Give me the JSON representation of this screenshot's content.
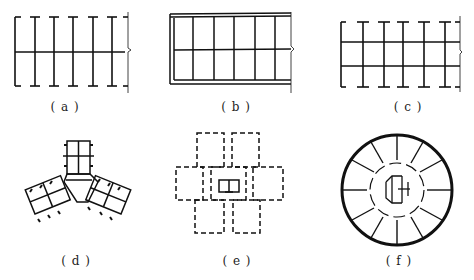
{
  "figure": {
    "panels": [
      {
        "id": "a",
        "label": "( a )",
        "description": "Rectangular plan, single central corridor, rooms both sides, open ends"
      },
      {
        "id": "b",
        "label": "( b )",
        "description": "Rectangular plan with double perimeter wall, central corridor"
      },
      {
        "id": "c",
        "label": "( c )",
        "description": "Rectangular plan with two corridors, three bays"
      },
      {
        "id": "d",
        "label": "( d )",
        "description": "Y-shaped three-wing plan with central core"
      },
      {
        "id": "e",
        "label": "( e )",
        "description": "Cruciform cluster plan with dashed walls and central core"
      },
      {
        "id": "f",
        "label": "( f )",
        "description": "Circular plan with radial rooms and central core"
      }
    ]
  }
}
